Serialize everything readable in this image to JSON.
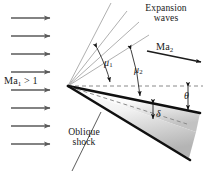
{
  "figure": {
    "type": "diagram"
  },
  "labels": {
    "expansion_waves_line1": "Expansion",
    "expansion_waves_line2": "waves",
    "oblique_shock_line1": "Oblique",
    "oblique_shock_line2": "shock",
    "mach_upstream_prefix": "Ma",
    "mach_upstream_sub": "1",
    "mach_upstream_suffix": " > 1",
    "mach_downstream_prefix": "Ma",
    "mach_downstream_sub": "2",
    "mu1_symbol": "μ",
    "mu1_sub": "1",
    "mu2_symbol": "μ",
    "mu2_sub": "2",
    "theta_symbol": "θ",
    "delta_symbol": "δ"
  },
  "colors": {
    "background": "#ffffff",
    "arrow_gray": "#5a5a5a",
    "expansion_line": "#b3b3b3",
    "shock_black": "#101010",
    "dashed_gray": "#808080",
    "annotation_black": "#1a1a1a",
    "wedge_fill_light": "#ffffff",
    "wedge_fill_dark": "#b9b9b9"
  },
  "geometry": {
    "apex": {
      "x": 68,
      "y": 86
    },
    "freestream_arrows": {
      "count": 8,
      "x_start": 11,
      "x_end": 54,
      "y_values": [
        18,
        36,
        54,
        72,
        90,
        108,
        126,
        144
      ]
    },
    "expansion_fan_lines": [
      {
        "x2": 112,
        "y2": 4
      },
      {
        "x2": 126,
        "y2": 10
      },
      {
        "x2": 137,
        "y2": 20
      },
      {
        "x2": 146,
        "y2": 32
      }
    ],
    "centerline_dashed": {
      "x1": 68,
      "y1": 86,
      "x2": 202,
      "y2": 86
    },
    "upper_surface": {
      "x1": 68,
      "y1": 86,
      "x2": 200,
      "y2": 113
    },
    "lower_shock": {
      "x1": 68,
      "y1": 86,
      "x2": 190,
      "y2": 160
    },
    "wedge_dashed": {
      "x1": 68,
      "y1": 86,
      "x2": 186,
      "y2": 124
    },
    "ma2_arrow": {
      "x1": 147,
      "y1": 51,
      "x2": 203,
      "y2": 62
    },
    "oblique_leader": {
      "x1": 101,
      "y1": 113,
      "x2": 72,
      "y2": 170
    }
  },
  "annotations": {
    "mu1_arc_label": "μ₁",
    "mu2_arc_label": "μ₂",
    "theta_label": "θ",
    "delta_label": "δ"
  }
}
